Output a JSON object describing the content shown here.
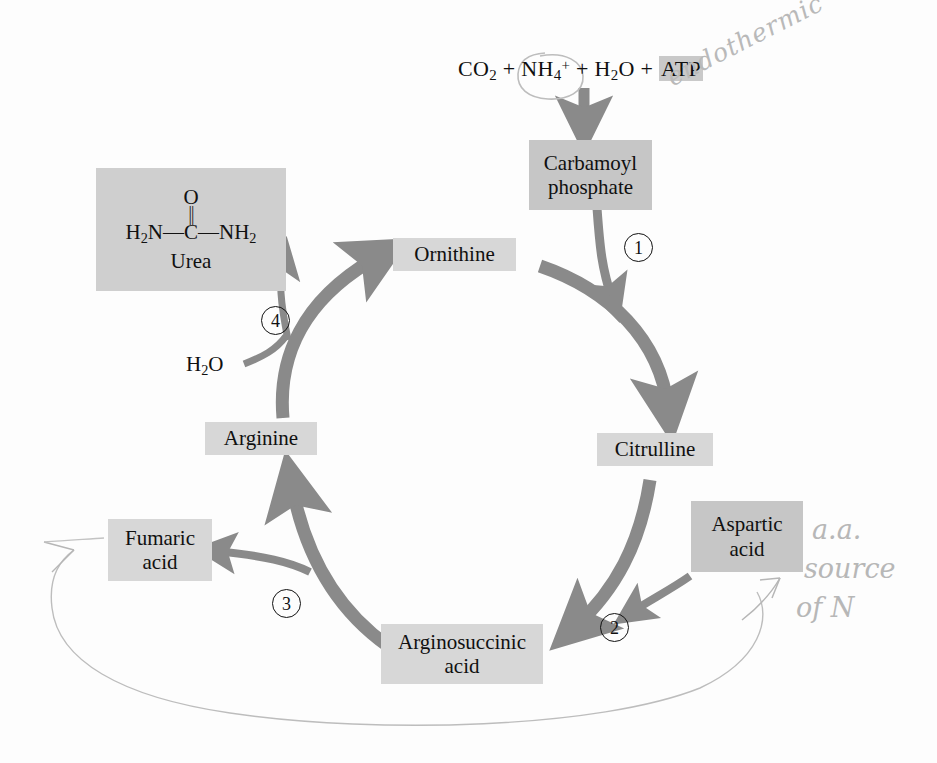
{
  "diagram": {
    "colors": {
      "box_fill": "#d7d7d7",
      "box_fill_dark": "#c6c6c6",
      "urea_box_fill": "#cfcfcf",
      "arrow_gray": "#8a8a8a",
      "text_black": "#101010",
      "pencil_gray": "#b4b4b4",
      "page_background": "#fdfdfd"
    }
  },
  "equation": {
    "co2": "CO",
    "co2_sub": "2",
    "plus1": "+",
    "nh4": "NH",
    "nh4_sub": "4",
    "nh4_sup": "+",
    "plus2": "+",
    "h2o": "H",
    "h2o_sub": "2",
    "h2o_rest": "O",
    "plus3": "+",
    "atp": "ATP",
    "full_text": "CO2 + NH4+ + H2O + ATP"
  },
  "nodes": {
    "carbamoyl_phosphate": {
      "line1": "Carbamoyl",
      "line2": "phosphate"
    },
    "citrulline": {
      "label": "Citrulline"
    },
    "aspartic_acid": {
      "line1": "Aspartic",
      "line2": "acid"
    },
    "arginosuccinic_acid": {
      "line1": "Arginosuccinic",
      "line2": "acid"
    },
    "fumaric_acid": {
      "line1": "Fumaric",
      "line2": "acid"
    },
    "arginine": {
      "label": "Arginine"
    },
    "ornithine": {
      "label": "Ornithine"
    },
    "water_input": {
      "h": "H",
      "sub": "2",
      "o": "O",
      "label": "H2O"
    },
    "urea": {
      "oxygen": "O",
      "double_bond": "||",
      "backbone_left": "H",
      "backbone_left_sub": "2",
      "backbone_left_rest": "N",
      "dash1": "—",
      "carbon": "C",
      "dash2": "—",
      "backbone_right": "NH",
      "backbone_right_sub": "2",
      "name": "Urea",
      "formula_text": "H2N—C(=O)—NH2"
    }
  },
  "enzyme_steps": [
    {
      "number": "1"
    },
    {
      "number": "2"
    },
    {
      "number": "3"
    },
    {
      "number": "4"
    }
  ],
  "annotations": {
    "endothermic": "endothermic",
    "aa_line1": "a.a.",
    "aa_line2": "source",
    "aa_line3": "of N",
    "circle_note": "NH4+ circled in pencil",
    "recycle_curve_note": "hand-drawn recycle arrow to Fumaric acid"
  }
}
